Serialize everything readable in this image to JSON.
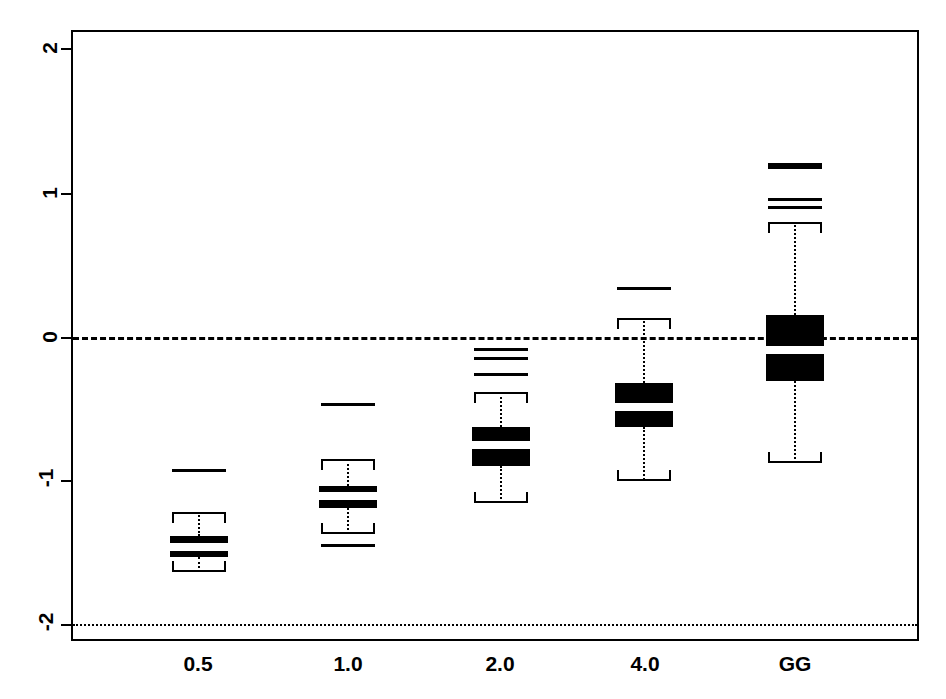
{
  "chart_data": {
    "type": "box",
    "title": "",
    "xlabel": "",
    "ylabel": "",
    "categories": [
      "0.5",
      "1.0",
      "2.0",
      "4.0",
      "GG"
    ],
    "ylim": [
      -2.14,
      2.14
    ],
    "yticks": [
      2,
      1,
      0,
      -1,
      -2
    ],
    "ytick_labels": [
      "2",
      "1",
      "0",
      "-1",
      "-2"
    ],
    "grid": false,
    "legend": null,
    "reference_lines": [
      {
        "name": "zero-line",
        "y": 0,
        "style": "dashed"
      },
      {
        "name": "lower-reference-line",
        "y": -2,
        "style": "dotted"
      }
    ],
    "boxes": [
      {
        "category": "0.5",
        "whisker_low": -1.64,
        "q1": -1.53,
        "median": -1.46,
        "q3": -1.39,
        "whisker_high": -1.22,
        "outliers": [
          -0.93
        ]
      },
      {
        "category": "1.0",
        "whisker_low": -1.37,
        "q1": -1.19,
        "median": -1.11,
        "q3": -1.04,
        "whisker_high": -0.85,
        "outliers": [
          -0.47,
          -1.45
        ]
      },
      {
        "category": "2.0",
        "whisker_low": -1.16,
        "q1": -0.9,
        "median": -0.75,
        "q3": -0.63,
        "whisker_high": -0.38,
        "outliers": [
          -0.09,
          -0.15,
          -0.26
        ]
      },
      {
        "category": "4.0",
        "whisker_low": -1.0,
        "q1": -0.63,
        "median": -0.49,
        "q3": -0.32,
        "whisker_high": 0.13,
        "outliers": [
          0.34
        ]
      },
      {
        "category": "GG",
        "whisker_low": -0.88,
        "q1": -0.31,
        "median": -0.09,
        "q3": 0.15,
        "whisker_high": 0.8,
        "outliers": [
          1.19,
          0.96,
          0.9
        ]
      }
    ]
  },
  "axis": {
    "y_labels": [
      "2",
      "1",
      "0",
      "-1",
      "-2"
    ],
    "x_labels": [
      "0.5",
      "1.0",
      "2.0",
      "4.0",
      "GG"
    ]
  }
}
